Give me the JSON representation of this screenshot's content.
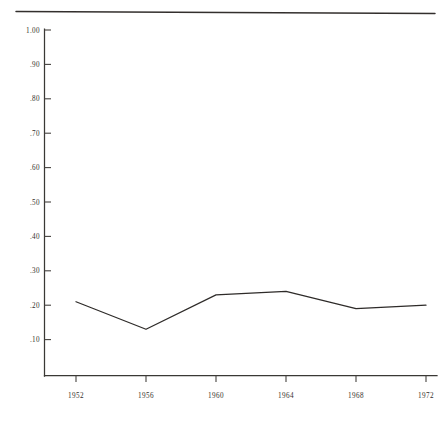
{
  "chart_data": {
    "type": "line",
    "title": "",
    "subtitle": "",
    "xlabel": "",
    "ylabel": "",
    "x": [
      1952,
      1956,
      1960,
      1964,
      1968,
      1972
    ],
    "categories": [
      "1952",
      "1956",
      "1960",
      "1964",
      "1968",
      "1972"
    ],
    "values": [
      0.21,
      0.13,
      0.23,
      0.24,
      0.19,
      0.2
    ],
    "series": [
      {
        "name": "series-1",
        "values": [
          0.21,
          0.13,
          0.23,
          0.24,
          0.19,
          0.2
        ]
      }
    ],
    "xlim": [
      1952,
      1972
    ],
    "ylim": [
      0.0,
      1.0
    ],
    "ytick_labels": [
      "1.00",
      ".90",
      ".80",
      ".70",
      ".60",
      ".50",
      ".40",
      ".30",
      ".20",
      ".10"
    ],
    "ytick_values": [
      1.0,
      0.9,
      0.8,
      0.7,
      0.6,
      0.5,
      0.4,
      0.3,
      0.2,
      0.1
    ],
    "xtick_labels": [
      "1952",
      "1956",
      "1960",
      "1964",
      "1968",
      "1972"
    ],
    "xtick_values": [
      1952,
      1956,
      1960,
      1964,
      1968,
      1972
    ],
    "grid": false,
    "legend": false,
    "legend_position": "none",
    "line_color": "#2e2b29",
    "axis_color": "#3a3835",
    "background_color": "#ffffff",
    "annotations": []
  },
  "axis": {
    "y_labels": [
      {
        "text": "1.00",
        "value": 1.0
      },
      {
        "text": ".90",
        "value": 0.9
      },
      {
        "text": ".80",
        "value": 0.8
      },
      {
        "text": ".70",
        "value": 0.7
      },
      {
        "text": ".60",
        "value": 0.6
      },
      {
        "text": ".50",
        "value": 0.5
      },
      {
        "text": ".40",
        "value": 0.4
      },
      {
        "text": ".30",
        "value": 0.3
      },
      {
        "text": ".20",
        "value": 0.2
      },
      {
        "text": ".10",
        "value": 0.1
      }
    ],
    "x_labels": [
      {
        "text": "1952",
        "value": 1952
      },
      {
        "text": "1956",
        "value": 1956
      },
      {
        "text": "1960",
        "value": 1960
      },
      {
        "text": "1964",
        "value": 1964
      },
      {
        "text": "1968",
        "value": 1968
      },
      {
        "text": "1972",
        "value": 1972
      }
    ]
  },
  "decor": {
    "top_rule": "horizontal-rule"
  }
}
